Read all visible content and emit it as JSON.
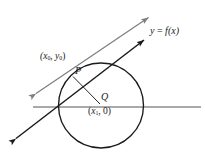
{
  "figure": {
    "kind": "geometry-diagram",
    "colors": {
      "axis": "#8c8c8c",
      "secant_line": "#7d7d7d",
      "tangent_line": "#1a1a1a",
      "circle": "#1a1a1a",
      "radius": "#1a1a1a",
      "text": "#1a1a1a",
      "background": "#ffffff"
    }
  },
  "labels": {
    "point_p": "P",
    "point_q": "Q",
    "point_p_coord_open": "(",
    "point_p_coord_x": "x",
    "point_p_coord_xsub": "0",
    "point_p_coord_sep": ", ",
    "point_p_coord_y": "y",
    "point_p_coord_ysub": "0",
    "point_p_coord_close": ")",
    "point_q_coord_open": "(",
    "point_q_coord_x": "x",
    "point_q_coord_xsub": "1",
    "point_q_coord_sep": ", 0)",
    "function_y": "y",
    "function_eq": " = ",
    "function_f": "f",
    "function_arg": "(x)"
  },
  "geometry": {
    "circle": {
      "cx": 101,
      "cy": 105.5,
      "r": 42.5
    },
    "point_p": {
      "x": 71.5,
      "y": 75.0
    },
    "point_q": {
      "x": 101,
      "y": 105.5
    },
    "axis": {
      "x1": 33,
      "y1": 107,
      "x2": 201,
      "y2": 107
    },
    "tangent_line": {
      "x1": 13,
      "y1": 141,
      "x2": 147,
      "y2": 38
    },
    "secant_line": {
      "x1": 32,
      "y1": 96,
      "x2": 152,
      "y2": 15
    },
    "function_arrow_tip": {
      "x": 147,
      "y": 38
    }
  }
}
